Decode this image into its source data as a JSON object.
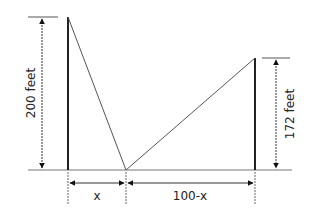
{
  "diagram": {
    "type": "two-poles-wire-geometry",
    "left_pole": {
      "height_label": "200 feet"
    },
    "right_pole": {
      "height_label": "172 feet"
    },
    "ground_segments": [
      {
        "label": "x"
      },
      {
        "label": "100-x"
      }
    ],
    "colors": {
      "line": "#222222",
      "ground": "#777777"
    }
  }
}
